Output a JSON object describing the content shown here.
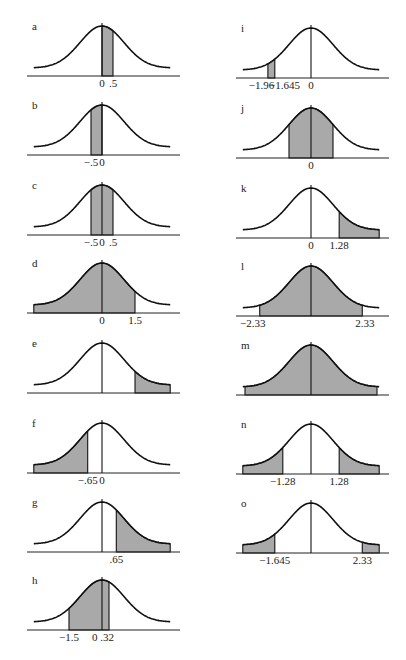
{
  "figure": {
    "shade_color": "#a9a9a9",
    "line_color": "#111111"
  },
  "panels": [
    {
      "id": "a",
      "label": "a",
      "col": 0,
      "row": 0,
      "shade": [
        [
          0,
          0.5
        ]
      ],
      "ticks": [
        {
          "x": 0,
          "text": "0"
        },
        {
          "x": 0.5,
          "text": ".5"
        }
      ]
    },
    {
      "id": "b",
      "label": "b",
      "col": 0,
      "row": 1,
      "shade": [
        [
          -0.5,
          0
        ]
      ],
      "ticks": [
        {
          "x": -0.5,
          "text": "−.5"
        },
        {
          "x": 0,
          "text": "0"
        }
      ]
    },
    {
      "id": "c",
      "label": "c",
      "col": 0,
      "row": 2,
      "shade": [
        [
          -0.5,
          0.5
        ]
      ],
      "ticks": [
        {
          "x": -0.5,
          "text": "−.5"
        },
        {
          "x": 0,
          "text": "0"
        },
        {
          "x": 0.5,
          "text": ".5"
        }
      ]
    },
    {
      "id": "d",
      "label": "d",
      "col": 0,
      "row": 3,
      "shade": [
        [
          -3.2,
          1.5
        ]
      ],
      "ticks": [
        {
          "x": 0,
          "text": "0"
        },
        {
          "x": 1.5,
          "text": "1.5"
        }
      ]
    },
    {
      "id": "e",
      "label": "e",
      "col": 0,
      "row": 4,
      "shade": [
        [
          1.5,
          3.2
        ]
      ],
      "ticks": []
    },
    {
      "id": "f",
      "label": "f",
      "col": 0,
      "row": 5,
      "shade": [
        [
          -3.2,
          -0.65
        ]
      ],
      "ticks": [
        {
          "x": -0.65,
          "text": "−.65"
        },
        {
          "x": 0,
          "text": "0"
        }
      ]
    },
    {
      "id": "g",
      "label": "g",
      "col": 0,
      "row": 6,
      "shade": [
        [
          0.65,
          3.2
        ]
      ],
      "ticks": [
        {
          "x": 0.65,
          "text": ".65"
        }
      ]
    },
    {
      "id": "h",
      "label": "h",
      "col": 0,
      "row": 7,
      "shade": [
        [
          -1.5,
          0.32
        ]
      ],
      "ticks": [
        {
          "x": -1.5,
          "text": "−1.5"
        },
        {
          "x": 0.05,
          "text": "0 .32"
        }
      ]
    },
    {
      "id": "i",
      "label": "i",
      "col": 1,
      "row": 0,
      "shade": [
        [
          -1.96,
          -1.645
        ]
      ],
      "ticks": [
        {
          "x": -2.25,
          "text": "−1.96"
        },
        {
          "x": -1.2,
          "text": "−1.645"
        },
        {
          "x": 0,
          "text": "0"
        }
      ]
    },
    {
      "id": "j",
      "label": "j",
      "col": 1,
      "row": 1,
      "shade": [
        [
          -1.0,
          1.0
        ]
      ],
      "ticks": [
        {
          "x": 0,
          "text": "0"
        }
      ]
    },
    {
      "id": "k",
      "label": "k",
      "col": 1,
      "row": 2,
      "shade": [
        [
          1.28,
          3.2
        ]
      ],
      "ticks": [
        {
          "x": 0,
          "text": "0"
        },
        {
          "x": 1.28,
          "text": "1.28"
        }
      ]
    },
    {
      "id": "l",
      "label": "l",
      "col": 1,
      "row": 3,
      "shade": [
        [
          -2.33,
          2.33
        ]
      ],
      "ticks": [
        {
          "x": -2.65,
          "text": "−2.33"
        },
        {
          "x": 2.45,
          "text": "2.33"
        }
      ]
    },
    {
      "id": "m",
      "label": "m",
      "col": 1,
      "row": 4,
      "shade": [
        [
          -3.0,
          3.0
        ]
      ],
      "ticks": []
    },
    {
      "id": "n",
      "label": "n",
      "col": 1,
      "row": 5,
      "shade": [
        [
          -3.2,
          -1.28
        ],
        [
          1.28,
          3.2
        ]
      ],
      "ticks": [
        {
          "x": -1.28,
          "text": "−1.28"
        },
        {
          "x": 1.28,
          "text": "1.28"
        }
      ]
    },
    {
      "id": "o",
      "label": "o",
      "col": 1,
      "row": 6,
      "shade": [
        [
          -3.2,
          -1.645
        ],
        [
          2.33,
          3.2
        ]
      ],
      "ticks": [
        {
          "x": -1.645,
          "text": "−1.645"
        },
        {
          "x": 2.33,
          "text": "2.33"
        }
      ]
    }
  ]
}
